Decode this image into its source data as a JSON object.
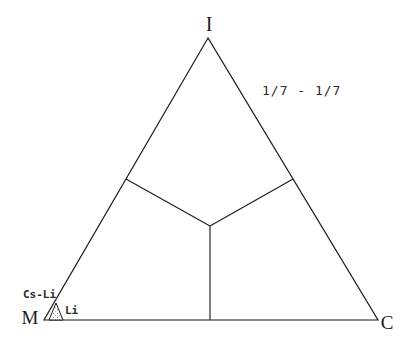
{
  "figure": {
    "type": "ternary-diagram",
    "background_color": "#ffffff",
    "line_color": "#1b1b1b",
    "vertices": {
      "top_label": "I",
      "bottom_left_label": "M",
      "bottom_right_label": "C"
    },
    "annotation": "1/7 - 1/7",
    "partition": "three internal lines from centroid to midpoints of each side",
    "marker": {
      "region_label": "Cs-Li",
      "point_label": "Li",
      "position": "bottom-left corner near M vertex",
      "style": "small stippled triangle"
    }
  }
}
